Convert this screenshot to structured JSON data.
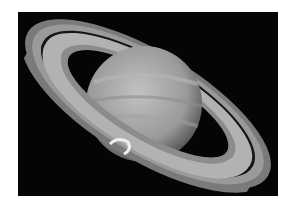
{
  "image": {
    "subject": "Saturn with rings and polar aurora",
    "background_color": "#050505",
    "border_color": "#ffffff",
    "colors": {
      "planet": "#a8a8a8",
      "rings_outer": "#8a8a8a",
      "rings_inner": "#b5b5b5",
      "cassini_division": "#111111",
      "aurora": "#f0f0f0"
    }
  }
}
